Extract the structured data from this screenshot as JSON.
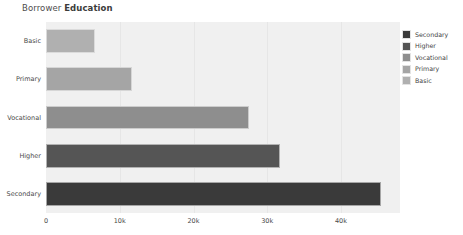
{
  "title": {
    "prefix": "Borrower",
    "emphasis": "Education"
  },
  "chart_data": {
    "type": "bar",
    "orientation": "horizontal",
    "title": "Borrower Education",
    "xlabel": "",
    "ylabel": "",
    "categories": [
      "Basic",
      "Primary",
      "Vocational",
      "Higher",
      "Secondary"
    ],
    "values": [
      6600,
      11700,
      27500,
      31700,
      45400
    ],
    "bar_colors": [
      "#b0b0b0",
      "#a5a5a5",
      "#8e8e8e",
      "#555555",
      "#3a3a3a"
    ],
    "xlim": [
      0,
      48000
    ],
    "xticks": [
      0,
      10000,
      20000,
      30000,
      40000
    ],
    "xtick_labels": [
      "0",
      "10k",
      "20k",
      "30k",
      "40k"
    ],
    "grid": true,
    "grid_axis": "x",
    "legend_position": "right",
    "legend": [
      {
        "label": "Secondary",
        "color": "#3a3a3a"
      },
      {
        "label": "Higher",
        "color": "#555555"
      },
      {
        "label": "Vocational",
        "color": "#8e8e8e"
      },
      {
        "label": "Primary",
        "color": "#a5a5a5"
      },
      {
        "label": "Basic",
        "color": "#b0b0b0"
      }
    ],
    "plot_background": "#f0f0f0",
    "page_background": "#ffffff"
  }
}
